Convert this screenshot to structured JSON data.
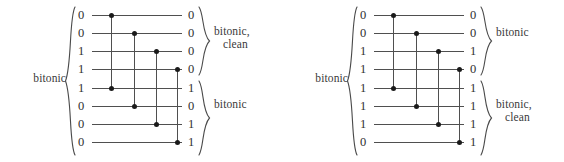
{
  "figures": [
    {
      "id": "left",
      "input_label": "bitonic",
      "inputs": [
        "0",
        "0",
        "1",
        "1",
        "1",
        "0",
        "0",
        "0"
      ],
      "outputs": [
        "0",
        "0",
        "0",
        "0",
        "1",
        "0",
        "1",
        "1"
      ],
      "output_groups": [
        {
          "lines": [
            "bitonic,",
            "clean"
          ]
        },
        {
          "lines": [
            "bitonic"
          ]
        }
      ]
    },
    {
      "id": "right",
      "input_label": "bitonic",
      "inputs": [
        "0",
        "0",
        "1",
        "1",
        "1",
        "1",
        "1",
        "0"
      ],
      "outputs": [
        "0",
        "0",
        "1",
        "0",
        "1",
        "1",
        "1",
        "1"
      ],
      "output_groups": [
        {
          "lines": [
            "bitonic"
          ]
        },
        {
          "lines": [
            "bitonic,",
            "clean"
          ]
        }
      ]
    }
  ],
  "network": {
    "rows": 8,
    "comparator_pairs": [
      [
        0,
        4
      ],
      [
        1,
        5
      ],
      [
        2,
        6
      ],
      [
        3,
        7
      ]
    ],
    "row_y": [
      15,
      33,
      51,
      69,
      88,
      106,
      124,
      142
    ],
    "comparator_x": [
      111,
      134,
      156,
      177
    ]
  },
  "colors": {
    "wire": "#4f4f4f",
    "dot": "#1a1a1a",
    "text": "#2f2f2f",
    "background": "#ffffff"
  }
}
